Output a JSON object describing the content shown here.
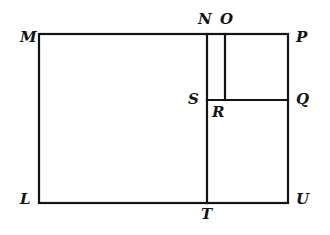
{
  "figure": {
    "name": "geometry-rectangle-partition-diagram",
    "type": "line-diagram",
    "width": 330,
    "height": 235,
    "background_color": "#ffffff",
    "stroke_color": "#141414",
    "stroke_width": 2.2,
    "outer_rectangle": {
      "left": 39,
      "right": 288,
      "top": 34,
      "bottom": 203,
      "corners": [
        "M",
        "P",
        "U",
        "L"
      ]
    },
    "segments": [
      {
        "name": "segment-NT",
        "x1": 207,
        "y1": 34,
        "x2": 207,
        "y2": 203
      },
      {
        "name": "segment-OR",
        "x1": 225,
        "y1": 34,
        "x2": 225,
        "y2": 100
      },
      {
        "name": "segment-SQ",
        "x1": 207,
        "y1": 100,
        "x2": 288,
        "y2": 100
      }
    ],
    "vertices": [
      {
        "id": "M",
        "label": "M",
        "x": 20,
        "y": 30,
        "position": "outside-top-left"
      },
      {
        "id": "N",
        "label": "N",
        "x": 198,
        "y": 12,
        "position": "above-top-edge"
      },
      {
        "id": "O",
        "label": "O",
        "x": 220,
        "y": 12,
        "position": "above-top-edge"
      },
      {
        "id": "P",
        "label": "P",
        "x": 296,
        "y": 30,
        "position": "outside-top-right"
      },
      {
        "id": "Q",
        "label": "Q",
        "x": 296,
        "y": 92,
        "position": "outside-right-edge"
      },
      {
        "id": "S",
        "label": "S",
        "x": 188,
        "y": 92,
        "position": "inside-left-of-vertical"
      },
      {
        "id": "R",
        "label": "R",
        "x": 212,
        "y": 105,
        "position": "inside-below-horizontal"
      },
      {
        "id": "L",
        "label": "L",
        "x": 20,
        "y": 192,
        "position": "outside-bottom-left"
      },
      {
        "id": "T",
        "label": "T",
        "x": 201,
        "y": 207,
        "position": "below-bottom-edge"
      },
      {
        "id": "U",
        "label": "U",
        "x": 296,
        "y": 192,
        "position": "outside-bottom-right"
      }
    ]
  }
}
